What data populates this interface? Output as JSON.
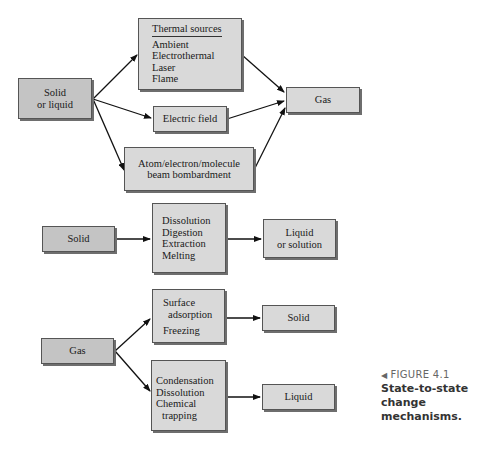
{
  "diagram": {
    "section1": {
      "source": {
        "lines": [
          "Solid",
          "or liquid"
        ]
      },
      "thermal": {
        "title": "Thermal sources",
        "items": [
          "Ambient",
          "Electrothermal",
          "Laser",
          "Flame"
        ]
      },
      "electric": {
        "label": "Electric field"
      },
      "bombardment": {
        "lines": [
          "Atom/electron/molecule",
          "beam bombardment"
        ]
      },
      "target": {
        "label": "Gas"
      }
    },
    "section2": {
      "source": {
        "label": "Solid"
      },
      "process": {
        "items": [
          "Dissolution",
          "Digestion",
          "Extraction",
          "Melting"
        ]
      },
      "target": {
        "lines": [
          "Liquid",
          "or solution"
        ]
      }
    },
    "section3": {
      "source": {
        "label": "Gas"
      },
      "process_top": {
        "items": [
          "Surface",
          "adsorption",
          "Freezing"
        ]
      },
      "target_top": {
        "label": "Solid"
      },
      "process_bottom": {
        "items": [
          "Condensation",
          "Dissolution",
          "Chemical",
          "trapping"
        ]
      },
      "target_bottom": {
        "label": "Liquid"
      }
    }
  },
  "caption": {
    "marker": "◀",
    "figure": "FIGURE 4.1",
    "title_lines": [
      "State-to-state change",
      "mechanisms."
    ]
  },
  "colors": {
    "box_fill": "#d9d9d9",
    "box_fill_dark": "#c4c4c4",
    "shadow": "#6e6e6e",
    "caption_gray": "#666666"
  }
}
